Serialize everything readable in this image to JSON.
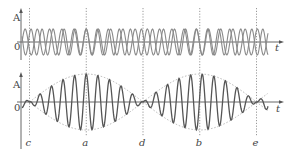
{
  "figure": {
    "top_panel": {
      "y_label": "A",
      "origin_label": "0",
      "x_label": "t",
      "description": "Two individual sinusoidal waves of slightly different frequency"
    },
    "bottom_panel": {
      "y_label": "A",
      "origin_label": "0",
      "x_label": "t",
      "description": "Resultant wave with dotted amplitude envelope"
    },
    "markers": [
      {
        "label": "c",
        "phase": "destructive"
      },
      {
        "label": "a",
        "phase": "constructive"
      },
      {
        "label": "d",
        "phase": "destructive"
      },
      {
        "label": "b",
        "phase": "constructive"
      },
      {
        "label": "e",
        "phase": "destructive"
      }
    ],
    "colors": {
      "individual_waves": "#8a8a8a",
      "resultant_wave": "#555555",
      "envelope": "#aaaaaa",
      "axes": "#666666"
    }
  }
}
